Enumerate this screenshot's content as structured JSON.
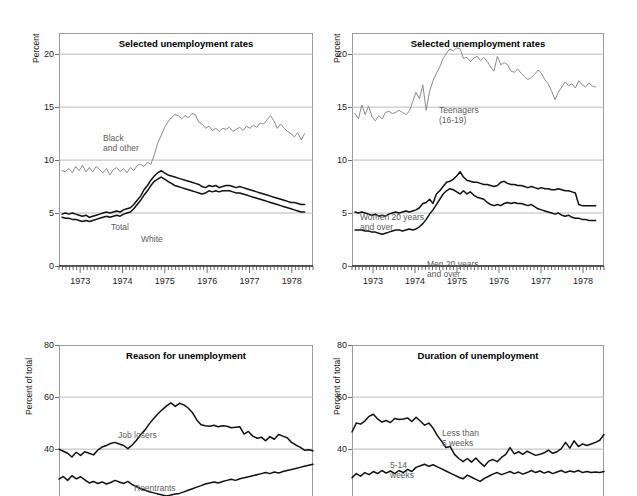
{
  "figure": {
    "background": "#ffffff",
    "width": 637,
    "height": 496
  },
  "colors": {
    "axis": "#6d6d6d",
    "grid": "#b9b9b9",
    "frame": "#9a9a9a",
    "dark_series": "#111111",
    "light_series": "#8a8a8a",
    "label_text": "#5c5c5c",
    "title_text": "#000000"
  },
  "panels": [
    {
      "id": "panel-top-left",
      "title": "Selected unemployment rates",
      "ylabel": "Percent",
      "yticks": [
        "0",
        "5",
        "10",
        "15",
        "20"
      ],
      "xticks": [
        "1973",
        "1974",
        "1975",
        "1976",
        "1977",
        "1978"
      ],
      "annotations": [
        {
          "name": "black-and-other-label",
          "text": "Black\nand other"
        },
        {
          "name": "total-label",
          "text": "Total"
        },
        {
          "name": "white-label",
          "text": "White"
        }
      ]
    },
    {
      "id": "panel-top-right",
      "title": "Selected unemployment rates",
      "ylabel": "Percent",
      "yticks": [
        "0",
        "5",
        "10",
        "15",
        "20"
      ],
      "xticks": [
        "1973",
        "1974",
        "1975",
        "1976",
        "1977",
        "1978"
      ],
      "annotations": [
        {
          "name": "teenagers-label",
          "text": "Teenagers\n(16-19)"
        },
        {
          "name": "women-20-and-over-label",
          "text": "Women 20 years\nand over"
        },
        {
          "name": "men-20-and-over-label",
          "text": "Men 20 years\nand over"
        }
      ]
    },
    {
      "id": "panel-bottom-left",
      "title": "Reason for unemployment",
      "ylabel": "Percent of total",
      "yticks": [
        "40",
        "60",
        "80"
      ],
      "xticks": [],
      "annotations": [
        {
          "name": "job-losers-label",
          "text": "Job losers"
        },
        {
          "name": "reentrants-label",
          "text": "Reentrants"
        }
      ]
    },
    {
      "id": "panel-bottom-right",
      "title": "Duration of unemployment",
      "ylabel": "Percent of total",
      "yticks": [
        "40",
        "60",
        "80"
      ],
      "xticks": [],
      "annotations": [
        {
          "name": "less-than-5-weeks-label",
          "text": "Less than\n5 weeks"
        },
        {
          "name": "five-to-fourteen-weeks-label",
          "text": "5-14\nweeks"
        }
      ]
    }
  ],
  "chart_data": [
    {
      "id": "panel-top-left",
      "type": "line",
      "title": "Selected unemployment rates",
      "xlabel": "",
      "ylabel": "Percent",
      "xlim": [
        1972.5,
        1978.5
      ],
      "ylim": [
        0,
        22
      ],
      "yticks": [
        0,
        5,
        10,
        15,
        20
      ],
      "xticks": [
        1973,
        1974,
        1975,
        1976,
        1977,
        1978
      ],
      "grid": true,
      "legend": "inline-annotations",
      "x_start": 1972.58,
      "x_step": 0.0833,
      "series": [
        {
          "name": "Black and other",
          "color": "#8a8a8a",
          "values": [
            9.0,
            8.9,
            9.2,
            8.8,
            9.4,
            9.0,
            9.5,
            8.9,
            9.3,
            8.9,
            9.4,
            9.1,
            8.8,
            9.2,
            8.6,
            9.1,
            9.3,
            8.9,
            9.2,
            8.8,
            9.3,
            9.0,
            9.5,
            9.6,
            9.4,
            9.8,
            9.6,
            10.5,
            11.6,
            12.3,
            13.1,
            13.6,
            14.0,
            14.3,
            14.2,
            13.9,
            14.2,
            14.0,
            14.4,
            14.3,
            13.6,
            13.4,
            13.0,
            13.2,
            12.8,
            13.0,
            12.7,
            13.0,
            12.9,
            13.1,
            12.7,
            12.9,
            13.1,
            12.8,
            13.2,
            13.0,
            13.3,
            13.1,
            13.5,
            13.4,
            13.8,
            14.2,
            13.7,
            13.0,
            13.4,
            13.0,
            12.7,
            12.5,
            12.2,
            12.6,
            11.9,
            12.5
          ]
        },
        {
          "name": "Total",
          "color": "#111111",
          "values": [
            4.9,
            5.0,
            4.9,
            5.0,
            4.9,
            4.8,
            4.7,
            4.8,
            4.6,
            4.7,
            4.8,
            4.9,
            5.0,
            5.1,
            5.0,
            5.1,
            5.2,
            5.1,
            5.3,
            5.4,
            5.5,
            5.8,
            6.2,
            6.6,
            7.2,
            7.6,
            8.1,
            8.5,
            8.8,
            9.0,
            8.8,
            8.6,
            8.5,
            8.4,
            8.3,
            8.2,
            8.1,
            8.0,
            7.9,
            7.8,
            7.7,
            7.5,
            7.4,
            7.6,
            7.5,
            7.6,
            7.4,
            7.5,
            7.6,
            7.6,
            7.5,
            7.4,
            7.5,
            7.4,
            7.3,
            7.2,
            7.1,
            7.0,
            6.9,
            6.8,
            6.7,
            6.6,
            6.5,
            6.4,
            6.3,
            6.2,
            6.1,
            6.0,
            6.0,
            5.9,
            5.8,
            5.8
          ]
        },
        {
          "name": "White",
          "color": "#111111",
          "values": [
            4.6,
            4.5,
            4.5,
            4.4,
            4.4,
            4.3,
            4.2,
            4.3,
            4.2,
            4.3,
            4.4,
            4.5,
            4.6,
            4.7,
            4.6,
            4.7,
            4.8,
            4.7,
            4.9,
            5.0,
            5.1,
            5.4,
            5.8,
            6.2,
            6.7,
            7.1,
            7.6,
            8.0,
            8.2,
            8.4,
            8.2,
            8.0,
            7.8,
            7.6,
            7.5,
            7.4,
            7.3,
            7.2,
            7.1,
            7.0,
            6.9,
            6.8,
            6.9,
            7.1,
            7.0,
            7.1,
            7.0,
            7.1,
            7.1,
            7.1,
            7.0,
            6.9,
            6.9,
            6.8,
            6.7,
            6.6,
            6.5,
            6.4,
            6.3,
            6.2,
            6.1,
            6.0,
            5.9,
            5.8,
            5.7,
            5.6,
            5.5,
            5.4,
            5.3,
            5.2,
            5.1,
            5.1
          ]
        }
      ]
    },
    {
      "id": "panel-top-right",
      "type": "line",
      "title": "Selected unemployment rates",
      "xlabel": "",
      "ylabel": "Percent",
      "xlim": [
        1972.5,
        1978.5
      ],
      "ylim": [
        0,
        22
      ],
      "yticks": [
        0,
        5,
        10,
        15,
        20
      ],
      "xticks": [
        1973,
        1974,
        1975,
        1976,
        1977,
        1978
      ],
      "grid": true,
      "legend": "inline-annotations",
      "x_start": 1972.58,
      "x_step": 0.0833,
      "series": [
        {
          "name": "Teenagers (16-19)",
          "color": "#8a8a8a",
          "values": [
            14.4,
            13.9,
            15.2,
            14.3,
            15.1,
            14.1,
            13.7,
            14.2,
            13.9,
            14.5,
            14.6,
            14.4,
            14.5,
            14.7,
            14.5,
            14.3,
            14.6,
            15.5,
            16.4,
            15.8,
            17.1,
            14.7,
            16.5,
            17.5,
            18.2,
            18.8,
            19.6,
            20.1,
            20.5,
            20.3,
            20.6,
            20.5,
            19.6,
            19.7,
            19.3,
            19.6,
            19.8,
            19.4,
            19.7,
            19.3,
            18.8,
            18.4,
            19.8,
            19.0,
            19.2,
            19.0,
            18.4,
            18.3,
            18.6,
            18.2,
            17.9,
            17.6,
            17.8,
            18.1,
            18.5,
            18.2,
            17.6,
            17.2,
            16.5,
            15.7,
            16.4,
            16.9,
            17.4,
            17.0,
            17.2,
            16.8,
            17.5,
            17.1,
            16.9,
            17.3,
            17.0,
            16.9
          ]
        },
        {
          "name": "Women 20 years and over",
          "color": "#111111",
          "values": [
            5.1,
            5.0,
            5.1,
            5.0,
            4.9,
            4.8,
            4.9,
            4.7,
            4.8,
            4.7,
            4.9,
            5.0,
            5.1,
            5.0,
            5.1,
            5.2,
            5.1,
            5.2,
            5.3,
            5.5,
            5.9,
            6.0,
            6.3,
            5.9,
            6.8,
            7.1,
            7.5,
            7.9,
            8.0,
            8.2,
            8.5,
            8.9,
            8.4,
            8.1,
            8.0,
            7.9,
            7.9,
            7.8,
            7.7,
            7.7,
            7.6,
            7.5,
            7.6,
            7.9,
            8.0,
            7.8,
            7.7,
            7.7,
            7.6,
            7.6,
            7.5,
            7.4,
            7.5,
            7.4,
            7.3,
            7.4,
            7.3,
            7.3,
            7.2,
            7.2,
            7.3,
            7.2,
            7.1,
            7.1,
            7.0,
            6.9,
            5.8,
            5.7,
            5.7,
            5.7,
            5.7,
            5.7
          ]
        },
        {
          "name": "Men 20 years and over",
          "color": "#111111",
          "values": [
            3.4,
            3.4,
            3.4,
            3.3,
            3.3,
            3.2,
            3.2,
            3.1,
            3.0,
            3.1,
            3.2,
            3.3,
            3.4,
            3.4,
            3.3,
            3.4,
            3.5,
            3.4,
            3.5,
            3.7,
            4.0,
            4.4,
            4.9,
            5.3,
            5.8,
            6.3,
            6.8,
            7.1,
            7.3,
            7.2,
            7.0,
            6.8,
            7.1,
            6.8,
            7.0,
            6.7,
            6.5,
            6.4,
            6.3,
            6.0,
            5.8,
            5.7,
            5.8,
            5.7,
            5.9,
            6.0,
            5.9,
            6.0,
            5.9,
            5.9,
            5.8,
            5.7,
            5.8,
            5.6,
            5.4,
            5.3,
            5.2,
            5.1,
            5.0,
            4.9,
            5.0,
            4.8,
            4.7,
            4.8,
            4.6,
            4.5,
            4.5,
            4.4,
            4.4,
            4.3,
            4.3,
            4.3
          ]
        }
      ]
    },
    {
      "id": "panel-bottom-left",
      "type": "line",
      "title": "Reason for unemployment",
      "xlabel": "",
      "ylabel": "Percent of total",
      "ylim": [
        22,
        80
      ],
      "yticks": [
        40,
        60,
        80
      ],
      "xticks": [],
      "grid": true,
      "legend": "inline-annotations",
      "note": "panel cropped by image bottom edge",
      "series": [
        {
          "name": "Job losers",
          "color": "#111111",
          "values": [
            40.0,
            39.2,
            38.4,
            37.0,
            38.8,
            37.6,
            39.0,
            38.4,
            37.8,
            39.6,
            40.8,
            41.4,
            42.2,
            42.6,
            42.0,
            41.4,
            40.2,
            41.6,
            43.4,
            45.6,
            47.4,
            49.8,
            51.8,
            53.6,
            55.2,
            56.6,
            57.8,
            56.4,
            57.6,
            57.0,
            55.8,
            54.0,
            51.2,
            49.4,
            49.0,
            48.8,
            49.2,
            48.6,
            49.0,
            48.8,
            48.2,
            48.4,
            48.6,
            45.8,
            46.8,
            45.0,
            44.2,
            44.6,
            43.2,
            44.8,
            43.8,
            45.6,
            45.0,
            44.4,
            42.6,
            41.6,
            40.8,
            39.6,
            39.8,
            39.4
          ]
        },
        {
          "name": "Reentrants",
          "color": "#111111",
          "values": [
            28.5,
            29.5,
            28.0,
            29.8,
            28.6,
            29.4,
            28.2,
            27.0,
            27.6,
            26.8,
            27.4,
            26.6,
            27.2,
            28.0,
            27.4,
            26.8,
            27.6,
            26.4,
            25.6,
            24.8,
            24.2,
            23.6,
            23.2,
            22.8,
            22.4,
            22.0,
            22.4,
            22.8,
            23.0,
            23.6,
            24.2,
            24.8,
            25.4,
            26.0,
            26.6,
            27.0,
            27.4,
            27.0,
            27.6,
            28.0,
            28.4,
            28.0,
            28.6,
            29.0,
            29.4,
            29.8,
            30.2,
            30.6,
            31.0,
            30.6,
            31.2,
            30.8,
            31.4,
            31.8,
            32.2,
            32.6,
            33.0,
            33.4,
            33.8,
            34.2
          ]
        }
      ]
    },
    {
      "id": "panel-bottom-right",
      "type": "line",
      "title": "Duration of unemployment",
      "xlabel": "",
      "ylabel": "Percent of total",
      "ylim": [
        22,
        80
      ],
      "yticks": [
        40,
        60,
        80
      ],
      "xticks": [],
      "grid": true,
      "legend": "inline-annotations",
      "note": "panel cropped by image bottom edge",
      "series": [
        {
          "name": "Less than 5 weeks",
          "color": "#111111",
          "values": [
            46.6,
            50.0,
            49.6,
            50.8,
            52.6,
            53.4,
            51.6,
            50.4,
            51.0,
            50.2,
            51.8,
            51.4,
            51.6,
            52.0,
            50.6,
            52.2,
            50.8,
            49.2,
            50.0,
            48.0,
            45.2,
            43.0,
            40.6,
            41.0,
            38.0,
            36.4,
            35.2,
            36.4,
            35.0,
            36.6,
            34.8,
            33.4,
            35.4,
            36.0,
            35.2,
            36.8,
            38.0,
            40.6,
            38.2,
            39.0,
            38.0,
            39.2,
            38.4,
            37.6,
            38.0,
            38.6,
            39.6,
            38.4,
            39.0,
            40.2,
            42.6,
            40.4,
            43.2,
            41.0,
            42.0,
            41.4,
            42.0,
            42.6,
            43.4,
            45.6
          ]
        },
        {
          "name": "5-14 weeks",
          "color": "#111111",
          "values": [
            29.0,
            30.6,
            29.6,
            31.0,
            30.2,
            31.4,
            30.6,
            31.8,
            30.8,
            31.6,
            30.6,
            31.8,
            31.0,
            32.2,
            31.4,
            33.0,
            33.6,
            34.2,
            33.4,
            34.0,
            33.2,
            32.4,
            31.6,
            30.8,
            30.0,
            29.2,
            28.6,
            30.0,
            29.2,
            28.4,
            27.6,
            28.8,
            29.6,
            30.4,
            31.0,
            30.2,
            30.8,
            31.4,
            30.6,
            31.2,
            30.4,
            31.0,
            31.8,
            31.0,
            31.6,
            30.8,
            31.4,
            30.6,
            31.2,
            31.8,
            31.0,
            31.6,
            31.2,
            31.8,
            31.0,
            31.4,
            31.0,
            31.2,
            31.0,
            31.4
          ]
        }
      ]
    }
  ]
}
